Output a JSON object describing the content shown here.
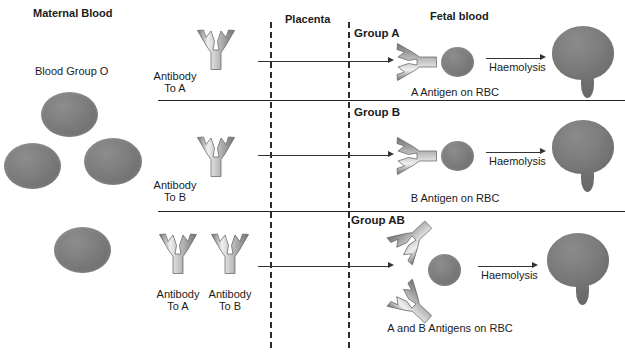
{
  "headers": {
    "maternal": "Maternal Blood",
    "placenta": "Placenta",
    "fetal": "Fetal blood"
  },
  "maternal": {
    "blood_group_label": "Blood Group O",
    "rbc_count": 4
  },
  "antibodies": {
    "to_a_line1": "Antibody",
    "to_a_line2": "To A",
    "to_b_line1": "Antibody",
    "to_b_line2": "To B"
  },
  "rows": [
    {
      "group_label": "Group A",
      "antigen_label": "A Antigen on RBC",
      "haemolysis_label": "Haemolysis",
      "antibody_label_line1": "Antibody",
      "antibody_label_line2": "To A"
    },
    {
      "group_label": "Group B",
      "antigen_label": "B Antigen on RBC",
      "haemolysis_label": "Haemolysis",
      "antibody_label_line1": "Antibody",
      "antibody_label_line2": "To B"
    },
    {
      "group_label": "Group AB",
      "antigen_label": "A and B Antigens on RBC",
      "haemolysis_label": "Haemolysis",
      "antibody_label_line1": "Antibody",
      "antibody_label_line2": "To A",
      "antibody2_label_line1": "Antibody",
      "antibody2_label_line2": "To B"
    }
  ],
  "colors": {
    "rbc": "#7e7e7e",
    "antibody_light": "#e6e6e6",
    "antibody_mid": "#a8a8a8",
    "antibody_dark": "#6f6f6f",
    "line": "#222222",
    "text": "#1b1b1b"
  }
}
